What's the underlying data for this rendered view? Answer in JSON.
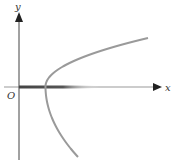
{
  "figure": {
    "type": "parabola-sketch",
    "labels": {
      "x_axis": "x",
      "y_axis": "y",
      "origin": "O"
    },
    "curve": {
      "equation_form": "x = a*y^2 + h (h > 0)",
      "opens": "right",
      "vertex_location": "positive x-axis",
      "color": "#9a9a9a"
    },
    "colors": {
      "axis": "#333333",
      "axis_highlight": "#555555",
      "curve": "#9a9a9a"
    }
  }
}
